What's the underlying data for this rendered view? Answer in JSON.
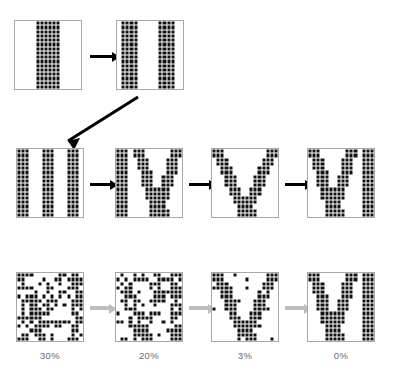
{
  "figure": {
    "title": "",
    "grid_size": 16,
    "colors": {
      "cell_on": "#111111",
      "cell_off": "#ffffff",
      "panel_border": "#a8a8a8",
      "arrow_black": "#000000",
      "arrow_gray": "#bdbdbd",
      "caption": "#6b6b6b"
    }
  },
  "rows": [
    {
      "name": "row-1-growth",
      "arrow_color": "#000000",
      "panels": [
        {
          "name": "panel-I",
          "label": "I",
          "pattern": "one-bar"
        },
        {
          "name": "panel-II",
          "label": "II",
          "pattern": "two-bars"
        }
      ]
    },
    {
      "name": "row-2-growth",
      "arrow_color": "#000000",
      "panels": [
        {
          "name": "panel-III",
          "label": "III",
          "pattern": "three-bars"
        },
        {
          "name": "panel-IV",
          "label": "IV",
          "pattern": "bar-plus-v"
        },
        {
          "name": "panel-V",
          "label": "V",
          "pattern": "v"
        },
        {
          "name": "panel-VI",
          "label": "VI",
          "pattern": "v-plus-bar"
        }
      ]
    },
    {
      "name": "row-3-denoise",
      "arrow_color": "#bdbdbd",
      "panels": [
        {
          "name": "panel-noise-30",
          "label": "VI",
          "pattern": "v-plus-bar",
          "noise": 0.3,
          "caption": "30%"
        },
        {
          "name": "panel-noise-20",
          "label": "VI",
          "pattern": "v-plus-bar",
          "noise": 0.2,
          "caption": "20%"
        },
        {
          "name": "panel-noise-03",
          "label": "V",
          "pattern": "v",
          "noise": 0.03,
          "caption": "3%"
        },
        {
          "name": "panel-noise-00",
          "label": "VI",
          "pattern": "v-plus-bar",
          "noise": 0.0,
          "caption": "0%"
        }
      ]
    }
  ],
  "captions": [
    "30%",
    "20%",
    "3%",
    "0%"
  ],
  "chart_data": {
    "type": "table",
    "title": "",
    "categories": [
      "30%",
      "20%",
      "3%",
      "0%"
    ],
    "values": [
      30,
      20,
      3,
      0
    ],
    "xlabel": "noise level",
    "ylabel": "percent corrupted cells",
    "ylim": [
      0,
      30
    ],
    "series": [
      {
        "name": "noise percentage",
        "values": [
          30,
          20,
          3,
          0
        ]
      }
    ],
    "annotations": [
      "30%",
      "20%",
      "3%",
      "0%"
    ]
  }
}
